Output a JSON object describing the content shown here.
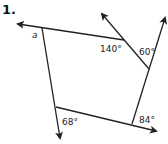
{
  "problem": {
    "number": "1."
  },
  "diagram": {
    "angles": {
      "a": "a",
      "top_inner": "140°",
      "right_top": "60°",
      "bottom_left": "68°",
      "bottom_right": "84°"
    },
    "line_color": "#222222"
  }
}
